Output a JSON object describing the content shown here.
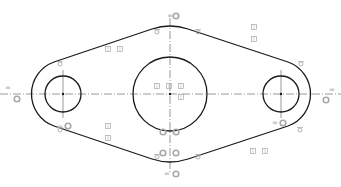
{
  "sketch": {
    "colors": {
      "geometry": "#1a1a1a",
      "centerline": "#555555",
      "constraint": "#a8a8a8"
    },
    "centerline_y": 94,
    "circles": [
      {
        "name": "left-hole",
        "cx": 63,
        "cy": 94,
        "r": 18
      },
      {
        "name": "center-hole",
        "cx": 170,
        "cy": 94,
        "r": 37
      },
      {
        "name": "right-hole",
        "cx": 281,
        "cy": 94,
        "r": 18
      }
    ],
    "equal_symbol": "=",
    "constraints": {
      "equal": [
        [
          170,
          16
        ],
        [
          8,
          88
        ],
        [
          332,
          90
        ],
        [
          167,
          174
        ],
        [
          60,
          127
        ],
        [
          275,
          123
        ]
      ],
      "concentric": [
        [
          176,
          16
        ],
        [
          17,
          99
        ],
        [
          326,
          100
        ],
        [
          176,
          174
        ],
        [
          68,
          126
        ],
        [
          283,
          123
        ],
        [
          163,
          132
        ],
        [
          176,
          132
        ],
        [
          163,
          153
        ],
        [
          176,
          153
        ]
      ],
      "tangent": [
        [
          60,
          64
        ],
        [
          157,
          32
        ],
        [
          198,
          32
        ],
        [
          301,
          64
        ],
        [
          60,
          130
        ],
        [
          157,
          157
        ],
        [
          198,
          157
        ],
        [
          300,
          130
        ]
      ],
      "dimension_boxes": [
        [
          108,
          49
        ],
        [
          120,
          49
        ],
        [
          254,
          27
        ],
        [
          254,
          39
        ],
        [
          157,
          86
        ],
        [
          169,
          86
        ],
        [
          181,
          86
        ],
        [
          181,
          97
        ],
        [
          108,
          126
        ],
        [
          108,
          138
        ],
        [
          253,
          151
        ],
        [
          265,
          151
        ]
      ]
    }
  }
}
